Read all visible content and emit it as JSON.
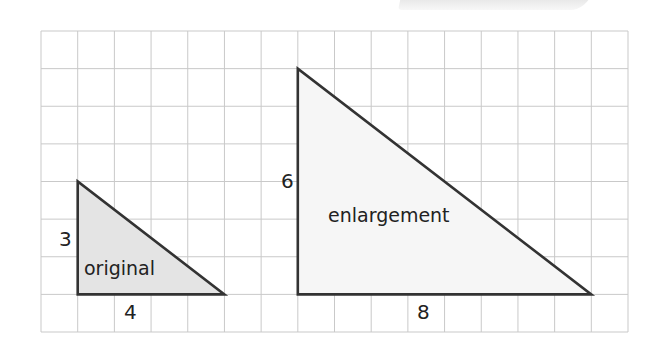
{
  "diagram": {
    "grid": {
      "columns": 16,
      "rows": 8,
      "line_color": "#c9c9c9"
    },
    "shapes": [
      {
        "id": "original",
        "label": "original",
        "fill": "#e4e4e4",
        "stroke": "#333333",
        "vertices_grid": [
          [
            1,
            4
          ],
          [
            1,
            7
          ],
          [
            5,
            7
          ]
        ],
        "side_labels": {
          "height": "3",
          "base": "4"
        }
      },
      {
        "id": "enlargement",
        "label": "enlargement",
        "fill": "#f6f6f6",
        "stroke": "#333333",
        "vertices_grid": [
          [
            7,
            1
          ],
          [
            7,
            7
          ],
          [
            15,
            7
          ]
        ],
        "side_labels": {
          "height": "6",
          "base": "8"
        }
      }
    ]
  }
}
